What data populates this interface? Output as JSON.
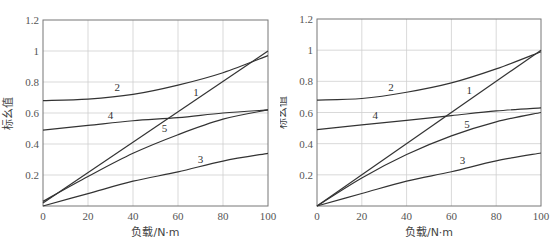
{
  "top_strip_text": [
    "",
    ""
  ],
  "chart_data": [
    {
      "type": "line",
      "panel": "left",
      "title": "",
      "xlabel": "负载/N·m",
      "ylabel": "标幺值",
      "xlim": [
        0,
        100
      ],
      "ylim": [
        0,
        1.2
      ],
      "xticks": [
        0,
        20,
        40,
        60,
        80,
        100
      ],
      "yticks": [
        0.2,
        0.4,
        0.6,
        0.8,
        1,
        1.2
      ],
      "xtick_labels": [
        "0",
        "20",
        "40",
        "60",
        "80",
        "100"
      ],
      "ytick_labels": [
        "0.2",
        "0.4",
        "0.6",
        "0.8",
        "1",
        "1.2"
      ],
      "grid": true,
      "legend": "inline numeric labels on curves",
      "x": [
        0,
        20,
        40,
        60,
        80,
        100
      ],
      "series": [
        {
          "name": "1",
          "values": [
            0.02,
            0.216,
            0.412,
            0.608,
            0.804,
            1.0
          ],
          "label_pos": [
            68,
            0.71
          ]
        },
        {
          "name": "2",
          "values": [
            0.68,
            0.69,
            0.72,
            0.78,
            0.86,
            0.97
          ],
          "label_pos": [
            33,
            0.74
          ]
        },
        {
          "name": "3",
          "values": [
            0.0,
            0.08,
            0.16,
            0.22,
            0.29,
            0.34
          ],
          "label_pos": [
            70,
            0.28
          ]
        },
        {
          "name": "4",
          "values": [
            0.49,
            0.52,
            0.55,
            0.57,
            0.6,
            0.62
          ],
          "label_pos": [
            30,
            0.56
          ]
        },
        {
          "name": "5",
          "values": [
            0.03,
            0.19,
            0.34,
            0.46,
            0.56,
            0.62
          ],
          "label_pos": [
            54,
            0.48
          ]
        }
      ]
    },
    {
      "type": "line",
      "panel": "right",
      "title": "",
      "xlabel": "负载/N·m",
      "ylabel": "标幺值",
      "xlim": [
        0,
        100
      ],
      "ylim": [
        0,
        1.2
      ],
      "xticks": [
        0,
        20,
        40,
        60,
        80,
        100
      ],
      "yticks": [
        0.2,
        0.4,
        0.6,
        0.8,
        1,
        1.2
      ],
      "xtick_labels": [
        "0",
        "20",
        "40",
        "60",
        "80",
        "100"
      ],
      "ytick_labels": [
        "0.2",
        "0.4",
        "0.6",
        "0.8",
        "1",
        "1.2"
      ],
      "grid": true,
      "legend": "inline numeric labels on curves",
      "x": [
        0,
        20,
        40,
        60,
        80,
        100
      ],
      "series": [
        {
          "name": "1",
          "values": [
            0.0,
            0.2,
            0.4,
            0.6,
            0.8,
            1.0
          ],
          "label_pos": [
            68,
            0.72
          ]
        },
        {
          "name": "2",
          "values": [
            0.68,
            0.69,
            0.73,
            0.79,
            0.88,
            0.99
          ],
          "label_pos": [
            33,
            0.74
          ]
        },
        {
          "name": "3",
          "values": [
            0.0,
            0.08,
            0.16,
            0.22,
            0.29,
            0.34
          ],
          "label_pos": [
            65,
            0.27
          ]
        },
        {
          "name": "4",
          "values": [
            0.49,
            0.52,
            0.55,
            0.58,
            0.61,
            0.63
          ],
          "label_pos": [
            26,
            0.56
          ]
        },
        {
          "name": "5",
          "values": [
            0.0,
            0.18,
            0.33,
            0.45,
            0.54,
            0.6
          ],
          "label_pos": [
            67,
            0.5
          ]
        }
      ]
    }
  ]
}
